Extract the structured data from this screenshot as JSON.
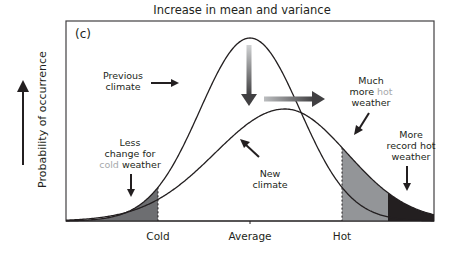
{
  "figure": {
    "title": "Increase in mean and variance",
    "panel_label": "(c)",
    "y_axis_label": "Probability of occurrence",
    "x_ticks": [
      "Cold",
      "Average",
      "Hot"
    ]
  },
  "annotations": {
    "previous_climate": [
      "Previous",
      "climate"
    ],
    "new_climate": [
      "New",
      "climate"
    ],
    "less_cold": {
      "line1": "Less",
      "line2": "change for",
      "line3_highlight": "cold",
      "line3_rest": " weather"
    },
    "more_hot": {
      "line1": "Much",
      "line2_prefix": "more ",
      "line2_highlight": "hot",
      "line3": "weather"
    },
    "record_hot": [
      "More",
      "record hot",
      "weather"
    ]
  },
  "colors": {
    "curve": "#231f20",
    "shade_light": "#939598",
    "shade_dark": "#231f20",
    "highlight_text": "#a7a9ac",
    "frame": "#414042"
  },
  "chart_data": {
    "type": "line",
    "title": "Increase in mean and variance",
    "xlabel": "",
    "ylabel": "Probability of occurrence",
    "x_tick_labels": [
      "Cold",
      "Average",
      "Hot"
    ],
    "series": [
      {
        "name": "Previous climate",
        "mean": 0.0,
        "sd": 1.0,
        "peak_rel": 1.0
      },
      {
        "name": "New climate",
        "mean": 0.7,
        "sd": 1.35,
        "peak_rel": 0.61
      }
    ],
    "thresholds": {
      "cold": -1.85,
      "hot": 1.85,
      "record_hot": 2.75
    },
    "shaded_regions": [
      {
        "name": "Less change for cold weather",
        "range": [
          "-inf",
          "cold"
        ],
        "shade": "dark-gray"
      },
      {
        "name": "Much more hot weather",
        "range": [
          "hot",
          "record_hot"
        ],
        "shade": "gray"
      },
      {
        "name": "More record hot weather",
        "range": [
          "record_hot",
          "+inf"
        ],
        "shade": "black"
      }
    ],
    "grid": false,
    "legend": "none (inline annotations)"
  },
  "geometry": {
    "baseline": 221,
    "left": 66,
    "right": 434,
    "top": 21,
    "prev": {
      "mu": 250,
      "h": 183,
      "sL": 50,
      "sR": 50
    },
    "new": {
      "mu": 285,
      "h": 112,
      "sL": 70,
      "sR": 62
    },
    "cold_x": 158,
    "hot_x": 342,
    "record_x": 388
  }
}
